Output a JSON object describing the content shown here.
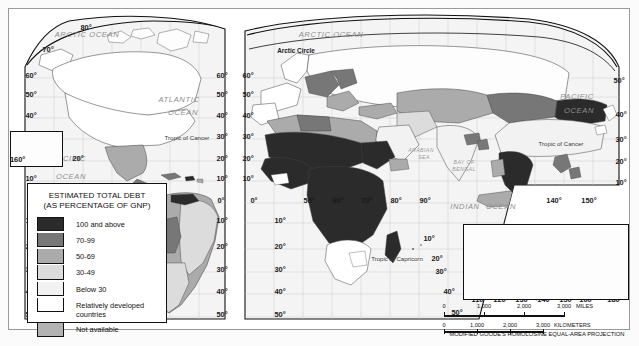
{
  "map": {
    "title_note": "MODIFIED GOODE'S HOMOLOSINE EQUAL-AREA PROJECTION",
    "ocean_labels": [
      {
        "text": "ARCTIC OCEAN",
        "x": 78,
        "y": 28
      },
      {
        "text": "ARCTIC OCEAN",
        "x": 322,
        "y": 28
      },
      {
        "text": "ATLANTIC",
        "x": 170,
        "y": 93
      },
      {
        "text": "OCEAN",
        "x": 174,
        "y": 106
      },
      {
        "text": "PACIFIC",
        "x": 60,
        "y": 152
      },
      {
        "text": "OCEAN",
        "x": 62,
        "y": 170
      },
      {
        "text": "PACIFIC",
        "x": 568,
        "y": 90
      },
      {
        "text": "OCEAN",
        "x": 570,
        "y": 104
      },
      {
        "text": "INDIAN",
        "x": 456,
        "y": 200
      },
      {
        "text": "OCEAN",
        "x": 492,
        "y": 200
      }
    ],
    "sea_labels": [
      {
        "text": "ARABIAN",
        "x": 412,
        "y": 143
      },
      {
        "text": "SEA",
        "x": 415,
        "y": 150
      },
      {
        "text": "BAY OF",
        "x": 455,
        "y": 155
      },
      {
        "text": "BENGAL",
        "x": 455,
        "y": 162
      },
      {
        "text": "CORAL SEA",
        "x": 573,
        "y": 237
      }
    ],
    "special_lines": [
      {
        "text": "Arctic Circle",
        "x": 287,
        "y": 44
      },
      {
        "text": "Tropic of Cancer",
        "x": 178,
        "y": 131
      },
      {
        "text": "Tropic of Cancer",
        "x": 552,
        "y": 137
      },
      {
        "text": "Tropic of Capricorn",
        "x": 388,
        "y": 252
      }
    ],
    "lat_labels_left_lobe1": [
      "80",
      "70",
      "60",
      "50",
      "40",
      "30",
      "20",
      "10",
      "0",
      "10",
      "20",
      "30",
      "40",
      "50"
    ],
    "graticule_labels": [
      {
        "text": "80°",
        "x": 77,
        "y": 21
      },
      {
        "text": "70°",
        "x": 39,
        "y": 43
      },
      {
        "text": "60°",
        "x": 22,
        "y": 69
      },
      {
        "text": "50°",
        "x": 22,
        "y": 88
      },
      {
        "text": "40°",
        "x": 22,
        "y": 109
      },
      {
        "text": "30°",
        "x": 22,
        "y": 130
      },
      {
        "text": "20°",
        "x": 69,
        "y": 152
      },
      {
        "text": "10°",
        "x": 22,
        "y": 172
      },
      {
        "text": "0°",
        "x": 22,
        "y": 194
      },
      {
        "text": "10°",
        "x": 22,
        "y": 214
      },
      {
        "text": "20°",
        "x": 22,
        "y": 240
      },
      {
        "text": "30°",
        "x": 22,
        "y": 263
      },
      {
        "text": "40°",
        "x": 22,
        "y": 285
      },
      {
        "text": "50°",
        "x": 22,
        "y": 308
      },
      {
        "text": "160°",
        "x": 12,
        "y": 157
      },
      {
        "text": "60°",
        "x": 213,
        "y": 69
      },
      {
        "text": "50°",
        "x": 213,
        "y": 88
      },
      {
        "text": "40°",
        "x": 213,
        "y": 109
      },
      {
        "text": "30°",
        "x": 213,
        "y": 130
      },
      {
        "text": "20°",
        "x": 213,
        "y": 152
      },
      {
        "text": "10°",
        "x": 213,
        "y": 172
      },
      {
        "text": "0°",
        "x": 212,
        "y": 194
      },
      {
        "text": "10°",
        "x": 213,
        "y": 214
      },
      {
        "text": "20°",
        "x": 213,
        "y": 240
      },
      {
        "text": "30°",
        "x": 213,
        "y": 263
      },
      {
        "text": "40°",
        "x": 213,
        "y": 285
      },
      {
        "text": "50°",
        "x": 213,
        "y": 308
      },
      {
        "text": "60°",
        "x": 239,
        "y": 69
      },
      {
        "text": "50°",
        "x": 239,
        "y": 88
      },
      {
        "text": "40°",
        "x": 239,
        "y": 109
      },
      {
        "text": "30°",
        "x": 239,
        "y": 130
      },
      {
        "text": "20°",
        "x": 239,
        "y": 152
      },
      {
        "text": "10°",
        "x": 239,
        "y": 172
      },
      {
        "text": "0°",
        "x": 245,
        "y": 194
      },
      {
        "text": "10°",
        "x": 271,
        "y": 214
      },
      {
        "text": "20°",
        "x": 271,
        "y": 240
      },
      {
        "text": "30°",
        "x": 271,
        "y": 263
      },
      {
        "text": "40°",
        "x": 271,
        "y": 285
      },
      {
        "text": "50°",
        "x": 271,
        "y": 308
      },
      {
        "text": "50°",
        "x": 300,
        "y": 194
      },
      {
        "text": "60°",
        "x": 329,
        "y": 194
      },
      {
        "text": "70°",
        "x": 358,
        "y": 194
      },
      {
        "text": "80°",
        "x": 387,
        "y": 194
      },
      {
        "text": "90°",
        "x": 416,
        "y": 194
      },
      {
        "text": "140°",
        "x": 545,
        "y": 194
      },
      {
        "text": "150°",
        "x": 580,
        "y": 194
      },
      {
        "text": "50°",
        "x": 613,
        "y": 74
      },
      {
        "text": "40°",
        "x": 616,
        "y": 108
      },
      {
        "text": "30°",
        "x": 616,
        "y": 133
      },
      {
        "text": "20°",
        "x": 616,
        "y": 155
      },
      {
        "text": "10°",
        "x": 616,
        "y": 176
      },
      {
        "text": "10°",
        "x": 420,
        "y": 232
      },
      {
        "text": "20°",
        "x": 428,
        "y": 252
      },
      {
        "text": "30°",
        "x": 432,
        "y": 265
      },
      {
        "text": "40°",
        "x": 440,
        "y": 285
      },
      {
        "text": "50°",
        "x": 448,
        "y": 306
      }
    ]
  },
  "legend": {
    "title_line1": "ESTIMATED TOTAL DEBT",
    "title_line2": "(AS PERCENTAGE OF GNP)",
    "items": [
      {
        "label": "100 and above",
        "color": "#2b2b2b"
      },
      {
        "label": "70-99",
        "color": "#777777"
      },
      {
        "label": "50-69",
        "color": "#ababab"
      },
      {
        "label": "30-49",
        "color": "#dcdcdc"
      },
      {
        "label": "Below 30",
        "color": "#f2f2f2"
      },
      {
        "label": "Relatively developed countries",
        "color": "#ffffff"
      },
      {
        "label": "Not available",
        "color": "#b3b3b3"
      }
    ]
  },
  "hawaii_inset": {
    "lon_label": "160°",
    "lat_label": "20°"
  },
  "australia_inset": {
    "lon_top": [
      "120°",
      "150°",
      "160°",
      "170°"
    ],
    "lon_bottom": [
      "110°",
      "120°",
      "130°",
      "140°",
      "150°",
      "160°",
      "180°"
    ],
    "lat_left": [
      "20°",
      "30°",
      "40°"
    ],
    "lat_right": [
      "20°",
      "30°"
    ],
    "sea_label": "CORAL SEA"
  },
  "scale": {
    "miles": {
      "ticks": [
        "0",
        "1,000",
        "2,000",
        "3,000"
      ],
      "unit": "MILES"
    },
    "kilometers": {
      "ticks": [
        "0",
        "1,000",
        "2,000",
        "3,000"
      ],
      "unit": "KILOMETERS"
    },
    "projection": "MODIFIED GOODE'S HOMOLOSINE EQUAL-AREA PROJECTION"
  },
  "colors": {
    "debt_100_plus": "#2b2b2b",
    "debt_70_99": "#777777",
    "debt_50_69": "#ababab",
    "debt_30_49": "#dcdcdc",
    "debt_below_30": "#f2f2f2",
    "developed": "#ffffff",
    "not_available": "#b3b3b3",
    "ocean": "#f4f4f4",
    "border": "#111111"
  }
}
